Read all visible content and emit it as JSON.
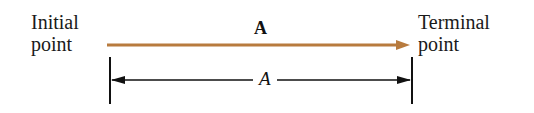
{
  "diagram": {
    "initial_label": [
      "Initial",
      "point"
    ],
    "terminal_label": [
      "Terminal",
      "point"
    ],
    "vector_label": "A",
    "magnitude_label": "A",
    "vector_color": "#b87b3e",
    "dimension_color": "#111111"
  }
}
